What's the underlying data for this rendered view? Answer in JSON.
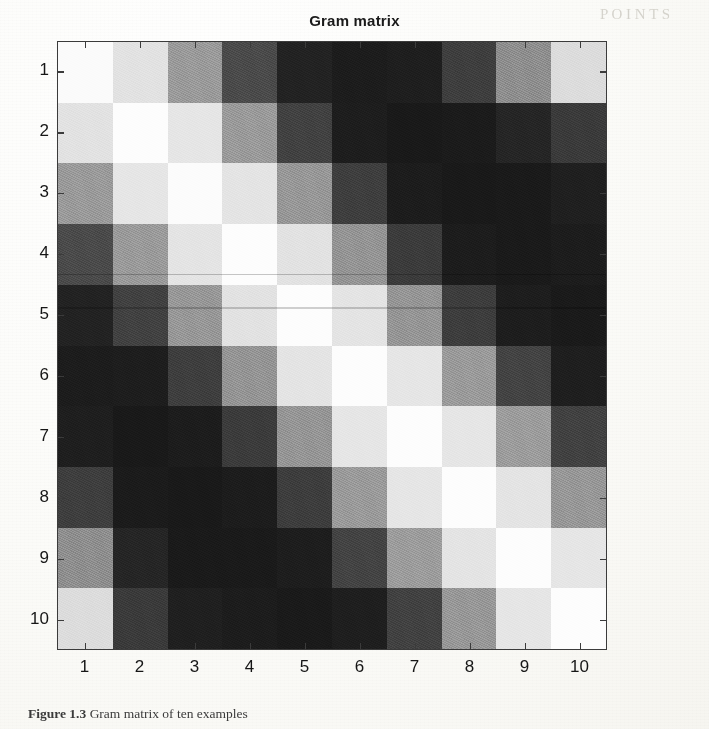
{
  "figure": {
    "title": "Gram matrix",
    "caption_prefix": "Figure 1.3",
    "caption_text": "Gram matrix of ten examples",
    "caption_visible": "Figure 1.3 Gram matrix of ten examples"
  },
  "axes": {
    "x_tick_labels": [
      "1",
      "2",
      "3",
      "4",
      "5",
      "6",
      "7",
      "8",
      "9",
      "10"
    ],
    "y_tick_labels": [
      "1",
      "2",
      "3",
      "4",
      "5",
      "6",
      "7",
      "8",
      "9",
      "10"
    ],
    "x_label": "",
    "y_label": "",
    "n_rows": 10,
    "n_cols": 10,
    "frame_color": "#3b3b3b"
  },
  "colormap": {
    "name": "gray",
    "min_color": "#151515",
    "max_color": "#fdfdfd",
    "levels": [
      "#151515",
      "#2a2a2a",
      "#3c3c3c",
      "#585858",
      "#8c8c8c",
      "#c9c9c9",
      "#ededed",
      "#fbfbfb"
    ]
  },
  "chart_data": {
    "type": "heatmap",
    "title": "Gram matrix",
    "xlabel": "",
    "ylabel": "",
    "x": [
      1,
      2,
      3,
      4,
      5,
      6,
      7,
      8,
      9,
      10
    ],
    "y": [
      1,
      2,
      3,
      4,
      5,
      6,
      7,
      8,
      9,
      10
    ],
    "xticklabels": [
      "1",
      "2",
      "3",
      "4",
      "5",
      "6",
      "7",
      "8",
      "9",
      "10"
    ],
    "yticklabels": [
      "1",
      "2",
      "3",
      "4",
      "5",
      "6",
      "7",
      "8",
      "9",
      "10"
    ],
    "colormap": "gray",
    "zlim": [
      0,
      1
    ],
    "grid": false,
    "legend": "none",
    "colorbar": false,
    "values": [
      [
        1.0,
        0.84,
        0.56,
        0.26,
        0.08,
        0.06,
        0.07,
        0.22,
        0.5,
        0.8
      ],
      [
        0.84,
        1.0,
        0.86,
        0.55,
        0.24,
        0.07,
        0.05,
        0.07,
        0.23,
        0.28
      ],
      [
        0.56,
        0.86,
        1.0,
        0.85,
        0.54,
        0.23,
        0.07,
        0.05,
        0.06,
        0.12
      ],
      [
        0.26,
        0.55,
        0.85,
        1.0,
        0.86,
        0.55,
        0.24,
        0.07,
        0.05,
        0.06
      ],
      [
        0.08,
        0.24,
        0.54,
        0.86,
        1.0,
        0.85,
        0.55,
        0.24,
        0.07,
        0.05
      ],
      [
        0.06,
        0.07,
        0.23,
        0.55,
        0.85,
        1.0,
        0.86,
        0.55,
        0.25,
        0.07
      ],
      [
        0.07,
        0.05,
        0.07,
        0.24,
        0.55,
        0.86,
        1.0,
        0.86,
        0.56,
        0.24
      ],
      [
        0.22,
        0.07,
        0.05,
        0.07,
        0.24,
        0.55,
        0.86,
        1.0,
        0.85,
        0.55
      ],
      [
        0.5,
        0.23,
        0.06,
        0.05,
        0.07,
        0.25,
        0.56,
        0.85,
        1.0,
        0.86
      ],
      [
        0.8,
        0.28,
        0.12,
        0.06,
        0.05,
        0.07,
        0.24,
        0.55,
        0.86,
        1.0
      ]
    ],
    "cell_colors": [
      [
        "#fbfbfb",
        "#e2e2e2",
        "#9a9a9a",
        "#4a4a4a",
        "#222222",
        "#1c1c1c",
        "#1e1e1e",
        "#3e3e3e",
        "#8e8e8e",
        "#dcdcdc"
      ],
      [
        "#e2e2e2",
        "#fdfdfd",
        "#e6e6e6",
        "#9a9a9a",
        "#414141",
        "#1d1d1d",
        "#191919",
        "#1b1b1b",
        "#252525",
        "#3a3a3a"
      ],
      [
        "#9a9a9a",
        "#e6e6e6",
        "#fcfcfc",
        "#e4e4e4",
        "#979797",
        "#3e3e3e",
        "#1c1c1c",
        "#191919",
        "#1a1a1a",
        "#1f1f1f"
      ],
      [
        "#4a4a4a",
        "#9a9a9a",
        "#e4e4e4",
        "#fdfdfd",
        "#e2e2e2",
        "#949494",
        "#3b3b3b",
        "#1c1c1c",
        "#1a1a1a",
        "#1c1c1c"
      ],
      [
        "#222222",
        "#414141",
        "#979797",
        "#e2e2e2",
        "#fdfdfd",
        "#e4e4e4",
        "#959595",
        "#3d3d3d",
        "#1d1d1d",
        "#1a1a1a"
      ],
      [
        "#1c1c1c",
        "#1d1d1d",
        "#3e3e3e",
        "#949494",
        "#e4e4e4",
        "#fdfdfd",
        "#e6e6e6",
        "#9a9a9a",
        "#434343",
        "#1e1e1e"
      ],
      [
        "#1e1e1e",
        "#191919",
        "#1c1c1c",
        "#3b3b3b",
        "#959595",
        "#e6e6e6",
        "#fdfdfd",
        "#e6e6e6",
        "#9c9c9c",
        "#414141"
      ],
      [
        "#3e3e3e",
        "#1b1b1b",
        "#191919",
        "#1c1c1c",
        "#3d3d3d",
        "#9a9a9a",
        "#e6e6e6",
        "#fdfdfd",
        "#e4e4e4",
        "#979797"
      ],
      [
        "#8e8e8e",
        "#252525",
        "#1a1a1a",
        "#1a1a1a",
        "#1d1d1d",
        "#434343",
        "#9c9c9c",
        "#e4e4e4",
        "#fdfdfd",
        "#e6e6e6"
      ],
      [
        "#dcdcdc",
        "#3a3a3a",
        "#1f1f1f",
        "#1c1c1c",
        "#1a1a1a",
        "#1e1e1e",
        "#414141",
        "#979797",
        "#e6e6e6",
        "#fdfdfd"
      ]
    ]
  },
  "bleed_through": [
    {
      "text": "P O I N T S",
      "x": 600,
      "y": 6,
      "size": 15,
      "rot": 0
    },
    {
      "text": "a process",
      "x": 230,
      "y": 185,
      "size": 17,
      "rot": 0
    },
    {
      "text": "we view",
      "x": 250,
      "y": 215,
      "size": 16,
      "rot": 0
    },
    {
      "text": "is defined",
      "x": 200,
      "y": 250,
      "size": 17,
      "rot": 0
    },
    {
      "text": "by",
      "x": 470,
      "y": 255,
      "size": 16,
      "rot": 0
    },
    {
      "text": "(x) (y)",
      "x": 300,
      "y": 310,
      "size": 17,
      "rot": 0
    },
    {
      "text": "the relation",
      "x": 250,
      "y": 370,
      "size": 16,
      "rot": 0
    },
    {
      "text": "s",
      "x": 320,
      "y": 400,
      "size": 15,
      "rot": 0
    }
  ]
}
